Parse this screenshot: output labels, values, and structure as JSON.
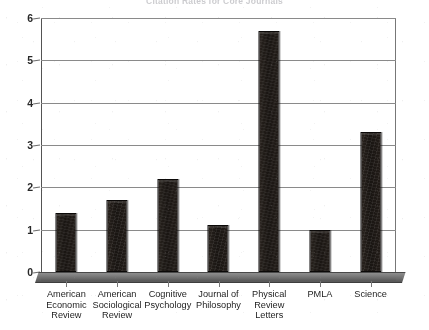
{
  "chart_data": {
    "type": "bar",
    "title": "Citation Rates for Core Journals",
    "categories": [
      "American Economic Review",
      "American Sociological Review",
      "Cognitive Psychology",
      "Journal of Philosophy",
      "Physical Review Letters",
      "PMLA",
      "Science"
    ],
    "category_lines": [
      [
        "American",
        "Economic",
        "Review"
      ],
      [
        "American",
        "Sociological",
        "Review"
      ],
      [
        "Cognitive",
        "Psychology"
      ],
      [
        "Journal of",
        "Philosophy"
      ],
      [
        "Physical",
        "Review",
        "Letters"
      ],
      [
        "PMLA"
      ],
      [
        "Science"
      ]
    ],
    "values": [
      1.4,
      1.7,
      2.2,
      1.1,
      5.7,
      1.0,
      3.3
    ],
    "xlabel": "",
    "ylabel": "",
    "ylim": [
      0,
      6
    ],
    "yticks": [
      0,
      1,
      2,
      3,
      4,
      5,
      6
    ],
    "ytick_labels": [
      "0",
      "1",
      "2",
      "3",
      "4",
      "5",
      "6"
    ],
    "grid": true,
    "legend": false,
    "legend_position": "none",
    "bar_color": "#1b1714",
    "grid_color": "#8a8a8a",
    "axis_color": "#555555",
    "background_color": "#ffffff"
  }
}
